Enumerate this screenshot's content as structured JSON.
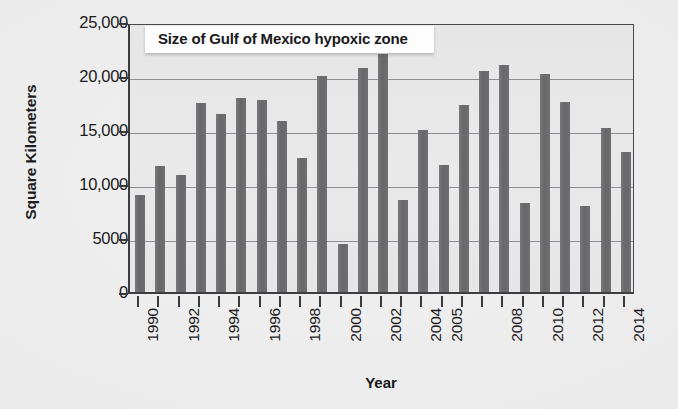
{
  "chart_data": {
    "type": "bar",
    "title": "Size of Gulf of Mexico hypoxic zone",
    "xlabel": "Year",
    "ylabel": "Square Kilometers",
    "ylim": [
      0,
      25000
    ],
    "ytick_values": [
      0,
      5000,
      10000,
      15000,
      20000,
      25000
    ],
    "ytick_labels": [
      "0",
      "5000",
      "10,000",
      "15,000",
      "20,000",
      "25,000"
    ],
    "grid": "horizontal",
    "legend": "none",
    "bar_color": "#6e6e70",
    "categories": [
      "1990",
      "1991",
      "1992",
      "1993",
      "1994",
      "1995",
      "1996",
      "1997",
      "1998",
      "1999",
      "2000",
      "2001",
      "2002",
      "2003",
      "2004",
      "2005",
      "2006",
      "2007",
      "2008",
      "2009",
      "2010",
      "2011",
      "2012",
      "2013",
      "2014"
    ],
    "values": [
      9000,
      11700,
      10800,
      17500,
      16500,
      18000,
      17800,
      15800,
      12400,
      20000,
      4400,
      20700,
      22000,
      8500,
      15000,
      11800,
      17300,
      20500,
      21000,
      8200,
      20200,
      17600,
      8000,
      15200,
      13000
    ],
    "xtick_labels_shown": [
      "1990",
      "1992",
      "1994",
      "1996",
      "1998",
      "2000",
      "2002",
      "2004",
      "2005",
      "2008",
      "2010",
      "2012",
      "2014"
    ],
    "xtick_label_indices": [
      0,
      2,
      4,
      6,
      8,
      10,
      12,
      14,
      15,
      18,
      20,
      22,
      24
    ]
  }
}
